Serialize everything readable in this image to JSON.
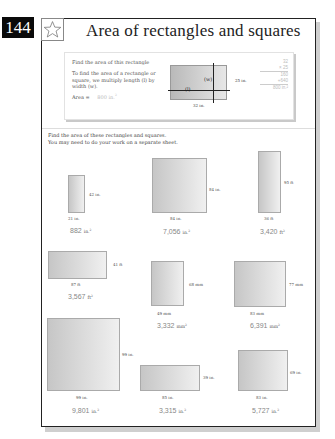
{
  "page": {
    "number": "144",
    "title": "Area of rectangles and squares",
    "icon": "star-icon"
  },
  "example": {
    "heading": "Find the area of this rectangle",
    "explanation": "To find the area of a rectangle or square, we multiply length (l) by width (w).",
    "area_label": "Area =",
    "area_value": "800 in.",
    "area_unit_power": "2",
    "label_l": "(l)",
    "label_w": "(w)",
    "width_dim": "25 in.",
    "length_dim": "32 in.",
    "calculation": [
      "32",
      "× 25",
      "160",
      "+640",
      "800 in.²"
    ]
  },
  "instructions": {
    "line1": "Find the area of these rectangles and squares.",
    "line2": "You may need to do your work on a separate sheet."
  },
  "problems": [
    {
      "length": "21 in.",
      "width": "42 in.",
      "answer": "882",
      "unit": "in.",
      "power": "2"
    },
    {
      "length": "84 in.",
      "width": "84 in.",
      "answer": "7,056",
      "unit": "in.",
      "power": "2"
    },
    {
      "length": "36 ft",
      "width": "95 ft",
      "answer": "3,420",
      "unit": "ft",
      "power": "2"
    },
    {
      "length": "87 ft",
      "width": "41 ft",
      "answer": "3,567",
      "unit": "ft",
      "power": "2"
    },
    {
      "length": "49 mm",
      "width": "68 mm",
      "answer": "3,332",
      "unit": "mm",
      "power": "2"
    },
    {
      "length": "83 mm",
      "width": "77 mm",
      "answer": "6,391",
      "unit": "mm",
      "power": "2"
    },
    {
      "length": "99 in.",
      "width": "99 in.",
      "answer": "9,801",
      "unit": "in.",
      "power": "2"
    },
    {
      "length": "85 in.",
      "width": "39 in.",
      "answer": "3,315",
      "unit": "in.",
      "power": "2"
    },
    {
      "length": "83 in.",
      "width": "69 in.",
      "answer": "5,727",
      "unit": "in.",
      "power": "2"
    }
  ]
}
